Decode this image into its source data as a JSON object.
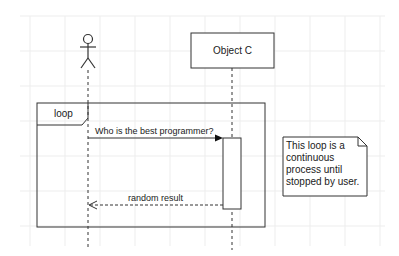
{
  "diagram": {
    "type": "sequence",
    "background": "#ffffff",
    "grid_color": "#ececec",
    "stroke_color": "#333333",
    "actor": {
      "label": ""
    },
    "object": {
      "label": "Object C"
    },
    "loop": {
      "label": "loop"
    },
    "messages": [
      {
        "label": "Who is the best programmer?",
        "style": "solid",
        "direction": "actor-to-object"
      },
      {
        "label": "random result",
        "style": "dashed",
        "direction": "object-to-actor"
      }
    ],
    "note": {
      "text": "This loop is a continuous process until stopped by user."
    }
  }
}
